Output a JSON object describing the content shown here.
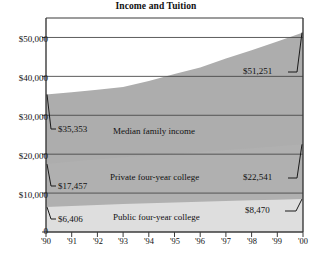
{
  "chart_data": {
    "type": "area",
    "title": "Income and Tuition",
    "xlabel": "",
    "ylabel": "",
    "x": [
      "'90",
      "'91",
      "'92",
      "'93",
      "'94",
      "'95",
      "'96",
      "'97",
      "'98",
      "'99",
      "'00"
    ],
    "xlim": [
      "'90",
      "'00"
    ],
    "ylim": [
      0,
      55000
    ],
    "yticks": [
      0,
      10000,
      20000,
      30000,
      40000,
      50000
    ],
    "ytick_labels": [
      "0",
      "$10,000",
      "$20,000",
      "$30,000",
      "$40,000",
      "$50,000"
    ],
    "grid": true,
    "legend": "inline-labels",
    "series": [
      {
        "name": "Median family income",
        "color": "#adadad",
        "values": [
          35353,
          35939,
          36573,
          37247,
          38782,
          40611,
          42300,
          44568,
          46737,
          48950,
          51251
        ],
        "start_value": 35353,
        "end_value": 51251,
        "start_label": "$35,353",
        "end_label": "$51,251"
      },
      {
        "name": "Private four-year college",
        "color": "#b0b0b0",
        "values": [
          17457,
          18100,
          18700,
          19200,
          19650,
          20100,
          20550,
          21050,
          21550,
          22050,
          22541
        ],
        "start_value": 17457,
        "end_value": 22541,
        "start_label": "$17,457",
        "end_label": "$22,541"
      },
      {
        "name": "Public four-year college",
        "color": "#dedede",
        "values": [
          6406,
          6700,
          6950,
          7180,
          7400,
          7600,
          7780,
          7960,
          8130,
          8300,
          8470
        ],
        "start_value": 6406,
        "end_value": 8470,
        "start_label": "$6,406",
        "end_label": "$8,470"
      }
    ],
    "annotations": [
      {
        "text": "$35,353",
        "anchor": "left",
        "series": "Median family income"
      },
      {
        "text": "$17,457",
        "anchor": "left",
        "series": "Private four-year college"
      },
      {
        "text": "$6,406",
        "anchor": "left",
        "series": "Public four-year college"
      },
      {
        "text": "$51,251",
        "anchor": "right",
        "series": "Median family income"
      },
      {
        "text": "$22,541",
        "anchor": "right",
        "series": "Private four-year college"
      },
      {
        "text": "$8,470",
        "anchor": "right",
        "series": "Public four-year college"
      }
    ]
  },
  "axis": {
    "y_labels": [
      "$50,000",
      "$40,000",
      "$30,000",
      "$20,000",
      "$10,000",
      "0"
    ],
    "x_labels": [
      "'90",
      "'91",
      "'92",
      "'93",
      "'94",
      "'95",
      "'96",
      "'97",
      "'98",
      "'99",
      "'00"
    ]
  },
  "labels": {
    "median_family_income": "Median family income",
    "private_college": "Private four-year college",
    "public_college": "Public four-year college",
    "v_income_left": "$35,353",
    "v_income_right": "$51,251",
    "v_private_left": "$17,457",
    "v_private_right": "$22,541",
    "v_public_left": "$6,406",
    "v_public_right": "$8,470"
  },
  "colors": {
    "band_income": "#adadad",
    "band_private": "#b2b2b2",
    "band_public": "#dedede",
    "axis": "#3b3b3b",
    "gridline": "#4a4a4a",
    "background": "#ffffff"
  }
}
